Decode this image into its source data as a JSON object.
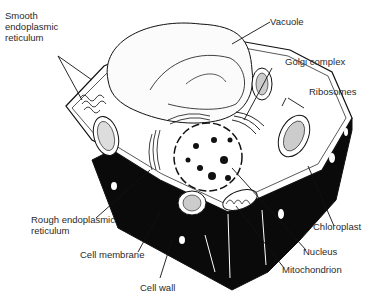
{
  "diagram": {
    "labels": {
      "smooth_er": "Smooth\nendoplasmic\nreticulum",
      "vacuole": "Vacuole",
      "golgi": "Golgi complex",
      "ribosomes": "Ribosomes",
      "rough_er": "Rough endoplasmic\nreticulum",
      "cell_membrane": "Cell membrane",
      "cell_wall": "Cell wall",
      "chloroplast": "Chloroplast",
      "nucleus": "Nucleus",
      "mitochondrion": "Mitochondrion"
    },
    "colors": {
      "ink": "#111111",
      "label": "#2a2a2a",
      "background": "#ffffff",
      "wall_fill": "#0a0a0a"
    }
  }
}
